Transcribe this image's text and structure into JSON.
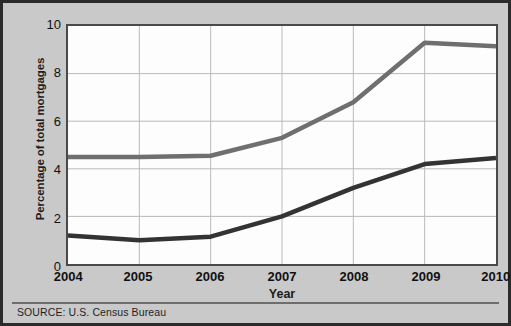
{
  "figure": {
    "background_color": "#c9c9c9",
    "border_color": "#2b2b2b",
    "plot_background_color": "#fdfdfd",
    "source_note": "SOURCE: U.S. Census Bureau"
  },
  "chart_data": {
    "type": "line",
    "title": "",
    "subtitle": "",
    "xlabel": "Year",
    "ylabel": "Percentage of total mortgages",
    "x": [
      2004,
      2005,
      2006,
      2007,
      2008,
      2009,
      2010
    ],
    "xtick_labels": [
      "2004",
      "2005",
      "2006",
      "2007",
      "2008",
      "2009",
      "2010"
    ],
    "ytick_labels": [
      "0",
      "2",
      "4",
      "6",
      "8",
      "10"
    ],
    "yticks": [
      0,
      2,
      4,
      6,
      8,
      10
    ],
    "xlim": [
      2004,
      2010
    ],
    "ylim": [
      0,
      10
    ],
    "grid": true,
    "grid_color": "#b9b9b9",
    "legend": "none",
    "legend_position": "none",
    "series": [
      {
        "name": "upper-series",
        "color": "#6f6f6f",
        "line_width": 4.5,
        "values": [
          4.5,
          4.5,
          4.55,
          5.3,
          6.8,
          9.3,
          9.15
        ]
      },
      {
        "name": "lower-series",
        "color": "#333333",
        "line_width": 4.5,
        "values": [
          1.2,
          1.0,
          1.15,
          2.0,
          3.2,
          4.2,
          4.45
        ]
      }
    ]
  }
}
